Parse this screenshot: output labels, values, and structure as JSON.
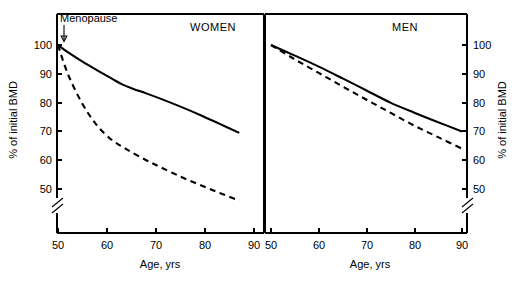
{
  "figure": {
    "background": "#ffffff",
    "ink_color": "#000000"
  },
  "axis_titles": {
    "x": "Age, yrs",
    "y": "% of initial BMD"
  },
  "annotation": {
    "menopause_label": "Menopause",
    "arrow_icon": "down-arrow-icon"
  },
  "ticklabels": {
    "y": [
      "100",
      "90",
      "80",
      "70",
      "60",
      "50"
    ],
    "x_women": [
      "50",
      "60",
      "70",
      "80",
      "90"
    ],
    "x_men": [
      "50",
      "60",
      "70",
      "80",
      "90"
    ]
  },
  "panels": {
    "women": {
      "title": "WOMEN"
    },
    "men": {
      "title": "MEN"
    }
  },
  "chart_data": {
    "type": "line",
    "title": "",
    "xlabel": "Age, yrs",
    "ylabel": "% of initial BMD",
    "xlim": [
      48,
      94
    ],
    "ylim": [
      44,
      104
    ],
    "yticks": [
      50,
      60,
      70,
      80,
      90,
      100
    ],
    "xticks": [
      50,
      60,
      70,
      80,
      90
    ],
    "grid": false,
    "legend": "none",
    "axis_break": {
      "axis": "y",
      "below": 50,
      "style": "double-slash"
    },
    "annotations": [
      {
        "text": "Menopause",
        "x": 50,
        "y": 100,
        "arrow": "down",
        "panel": "women"
      }
    ],
    "panels": [
      {
        "name": "women",
        "label": "WOMEN",
        "series": [
          {
            "name": "normal-bone-loss-women",
            "style": "solid",
            "x": [
              50,
              52,
              55,
              58,
              61,
              63,
              65,
              68,
              71,
              75,
              79,
              83,
              87
            ],
            "y": [
              100,
              97.5,
              94.2,
              91.2,
              88.3,
              86.4,
              85.0,
              83.2,
              81.3,
              78.6,
              75.7,
              72.6,
              69.5
            ]
          },
          {
            "name": "accelerated-bone-loss-women",
            "style": "dashed",
            "x": [
              50,
              52,
              55,
              58,
              61,
              63,
              65,
              68,
              71,
              75,
              79,
              83,
              87
            ],
            "y": [
              100,
              90.0,
              79.5,
              72.0,
              67.0,
              64.8,
              62.8,
              60.0,
              57.5,
              54.3,
              51.4,
              48.6,
              46.0
            ]
          }
        ]
      },
      {
        "name": "men",
        "label": "MEN",
        "series": [
          {
            "name": "normal-bone-loss-men",
            "style": "solid",
            "x": [
              50,
              55,
              60,
              65,
              70,
              75,
              80,
              85,
              90
            ],
            "y": [
              100,
              96.3,
              92.5,
              88.4,
              84.2,
              80.0,
              76.5,
              73.2,
              70.0
            ]
          },
          {
            "name": "accelerated-bone-loss-men",
            "style": "dashed",
            "x": [
              50,
              55,
              60,
              65,
              70,
              75,
              80,
              85,
              90
            ],
            "y": [
              100,
              95.0,
              90.3,
              85.6,
              81.0,
              76.5,
              72.0,
              68.0,
              64.0
            ]
          }
        ]
      }
    ]
  },
  "geometry": {
    "women_panel": {
      "x0": 57,
      "x1": 264,
      "y_top": 14,
      "y_bottom": 233
    },
    "men_panel": {
      "x0": 265,
      "x1": 467,
      "y_top": 14,
      "y_bottom": 233
    },
    "y_100_px": 45,
    "y_50_px": 189,
    "break_top_px": 198,
    "break_bottom_px": 214
  }
}
